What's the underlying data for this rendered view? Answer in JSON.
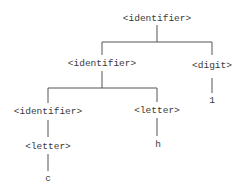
{
  "diagram": {
    "type": "parse-tree",
    "nodes": {
      "root": {
        "label": "<identifier>",
        "x": 157,
        "y": 21
      },
      "id2": {
        "label": "<identifier>",
        "x": 102,
        "y": 66
      },
      "digit": {
        "label": "<digit>",
        "x": 212,
        "y": 68
      },
      "one": {
        "label": "1",
        "x": 212,
        "y": 103
      },
      "id3": {
        "label": "<identifier>",
        "x": 48,
        "y": 114
      },
      "letter_h": {
        "label": "<letter>",
        "x": 157,
        "y": 113
      },
      "h": {
        "label": "h",
        "x": 158,
        "y": 147
      },
      "letter_c": {
        "label": "<letter>",
        "x": 48,
        "y": 149
      },
      "c": {
        "label": "c",
        "x": 48,
        "y": 181
      }
    },
    "edges": [
      [
        "root",
        "id2"
      ],
      [
        "root",
        "digit"
      ],
      [
        "digit",
        "one"
      ],
      [
        "id2",
        "id3"
      ],
      [
        "id2",
        "letter_h"
      ],
      [
        "letter_h",
        "h"
      ],
      [
        "id3",
        "letter_c"
      ],
      [
        "letter_c",
        "c"
      ]
    ]
  }
}
